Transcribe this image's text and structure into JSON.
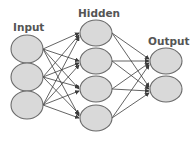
{
  "diagram": {
    "layers": [
      {
        "label": "Input",
        "count": 3
      },
      {
        "label": "Hidden",
        "count": 4
      },
      {
        "label": "Output",
        "count": 2
      }
    ],
    "labels": {
      "input": "Input",
      "hidden": "Hidden",
      "output": "Output"
    },
    "colors": {
      "node_fill": "#d9d9d9",
      "node_stroke": "#6a6a6a",
      "edge": "#3c3c3c",
      "label": "#555555"
    }
  }
}
